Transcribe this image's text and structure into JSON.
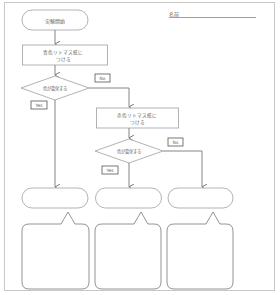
{
  "header": {
    "name_label": "名前"
  },
  "flowchart": {
    "start": {
      "label": "実験開始"
    },
    "process1": {
      "line1": "青色リトマス紙に",
      "line2": "つける"
    },
    "decision1": {
      "label": "色が変化する",
      "yes_label": "Yes",
      "no_label": "No"
    },
    "process2": {
      "line1": "赤色リトマス紙に",
      "line2": "つける"
    },
    "decision2": {
      "label": "色が変化する",
      "yes_label": "Yes",
      "no_label": "No"
    },
    "results": [
      {
        "label": ""
      },
      {
        "label": ""
      },
      {
        "label": ""
      }
    ],
    "answer_bubbles": [
      {
        "text": ""
      },
      {
        "text": ""
      },
      {
        "text": ""
      }
    ]
  },
  "colors": {
    "stroke": "#8a8a8a",
    "light_stroke": "#b5b5b5",
    "text": "#666666",
    "page_border": "#c8c8c8"
  }
}
